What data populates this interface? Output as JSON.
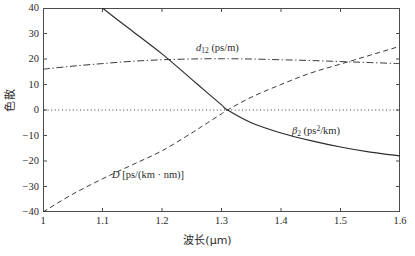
{
  "chart_data": {
    "type": "line",
    "title": "",
    "xlabel": "波长(μm)",
    "ylabel": "色散",
    "xlim": [
      1.0,
      1.6
    ],
    "ylim": [
      -40,
      40
    ],
    "xticks": [
      "1",
      "1.1",
      "1.2",
      "1.3",
      "1.4",
      "1.5",
      "1.6"
    ],
    "xtick_values": [
      1.0,
      1.1,
      1.2,
      1.3,
      1.4,
      1.5,
      1.6
    ],
    "yticks": [
      "40",
      "30",
      "20",
      "10",
      "0",
      "−10",
      "−20",
      "−30",
      "−40"
    ],
    "ytick_values": [
      40,
      30,
      20,
      10,
      0,
      -10,
      -20,
      -30,
      -40
    ],
    "grid": false,
    "legend": "inline-annotations",
    "zero_reference_line": {
      "y": 0,
      "style": "dotted",
      "color": "#3a3a3a"
    },
    "x": [
      1.0,
      1.05,
      1.1,
      1.15,
      1.2,
      1.25,
      1.27,
      1.3,
      1.31,
      1.35,
      1.4,
      1.45,
      1.5,
      1.55,
      1.6
    ],
    "series": [
      {
        "name": "β2",
        "label": "β₂ (ps²/km)",
        "unit": "ps^2/km",
        "style": "solid",
        "color": "#2b2b2b",
        "values": [
          62,
          50,
          40,
          31,
          22,
          12,
          8,
          2,
          0,
          -5,
          -9,
          -12,
          -14.5,
          -16.5,
          -18
        ]
      },
      {
        "name": "D",
        "label": "D [ps/(km · nm)]",
        "unit": "ps/(km*nm)",
        "style": "dashed",
        "color": "#3a3a3a",
        "values": [
          -40,
          -33,
          -27,
          -21.5,
          -16,
          -9,
          -6,
          -1.5,
          0,
          5,
          10,
          14.5,
          18,
          21.5,
          25
        ]
      },
      {
        "name": "d12",
        "label": "d₁₂ (ps/m)",
        "unit": "ps/m",
        "style": "dashdot",
        "color": "#3a3a3a",
        "values": [
          16,
          17.2,
          18.2,
          19.1,
          19.7,
          20.0,
          20.1,
          20.1,
          20.1,
          20.0,
          19.7,
          19.4,
          19.0,
          18.6,
          18.2
        ]
      }
    ],
    "annotations": [
      {
        "id": "d12",
        "text": "d₁₂ (ps/m)",
        "x": 1.26,
        "y": 31
      },
      {
        "id": "beta2",
        "text": "β₂ (ps²/km)",
        "x": 1.42,
        "y": -8
      },
      {
        "id": "D",
        "text": "D [ps/(km · nm)]",
        "x": 1.12,
        "y": -23
      }
    ]
  },
  "axis": {
    "ylabel": "色散",
    "xlabel": "波长(μm)"
  }
}
